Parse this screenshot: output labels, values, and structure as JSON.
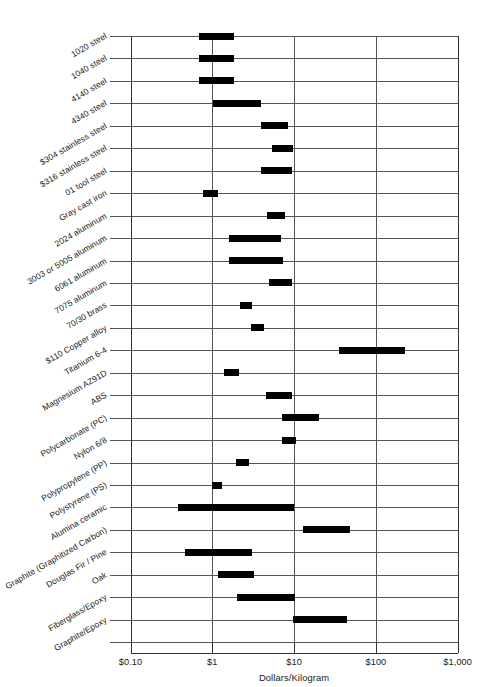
{
  "chart_data": {
    "type": "bar",
    "subtype": "floating-range-bar",
    "title": "",
    "xlabel": "Dollars/Kilogram",
    "ylabel": "",
    "xscale": "log",
    "xlim": [
      0.1,
      1000
    ],
    "xticks": [
      0.1,
      1,
      10,
      100,
      1000
    ],
    "xticklabels": [
      "$0.10",
      "$1",
      "$10",
      "$100",
      "$1,000"
    ],
    "grid": "horizontal row lines plus vertical decade lines",
    "legend": "none",
    "categories": [
      "1020 steel",
      "1040 steel",
      "4140 steel",
      "4340 steel",
      "$304 stainless steel",
      "$316 stainless steel",
      "01 tool steel",
      "Gray cast iron",
      "2024 aluminum",
      "3003 or 5005 aluminum",
      "6061 aluminum",
      "7075 aluminum",
      "70/30 brass",
      "$110 Copper alloy",
      "Titanium 6-4",
      "Magnesium AZ91D",
      "ABS",
      "Polycarbonate (PC)",
      "Nylon 6/8",
      "Polypropylene (PP)",
      "Polystyrene (PS)",
      "Alumina ceramic",
      "Graphite (Graphitized Carbon)",
      "Douglas Fir / Pine",
      "Oak",
      "Fiberglass/Epoxy",
      "Graphite/Epoxy"
    ],
    "ranges": [
      {
        "category": "1020 steel",
        "low": 0.68,
        "high": 1.85
      },
      {
        "category": "1040 steel",
        "low": 0.68,
        "high": 1.85
      },
      {
        "category": "4140 steel",
        "low": 0.68,
        "high": 1.85
      },
      {
        "category": "4340 steel",
        "low": 1.03,
        "high": 3.95
      },
      {
        "category": "$304 stainless steel",
        "low": 3.95,
        "high": 8.4
      },
      {
        "category": "$316 stainless steel",
        "low": 5.4,
        "high": 9.7
      },
      {
        "category": "01 tool steel",
        "low": 3.95,
        "high": 9.3
      },
      {
        "category": "Gray cast iron",
        "low": 0.78,
        "high": 1.18
      },
      {
        "category": "2024 aluminum",
        "low": 4.7,
        "high": 7.8
      },
      {
        "category": "3003 or 5005 aluminum",
        "low": 1.6,
        "high": 6.9
      },
      {
        "category": "6061 aluminum",
        "low": 1.6,
        "high": 7.4
      },
      {
        "category": "7075 aluminum",
        "low": 4.9,
        "high": 9.4
      },
      {
        "category": "70/30 brass",
        "low": 2.2,
        "high": 3.1
      },
      {
        "category": "$110 Copper alloy",
        "low": 3.0,
        "high": 4.3
      },
      {
        "category": "Titanium 6-4",
        "low": 35.0,
        "high": 230.0
      },
      {
        "category": "Magnesium AZ91D",
        "low": 1.4,
        "high": 2.1
      },
      {
        "category": "ABS",
        "low": 4.5,
        "high": 9.5
      },
      {
        "category": "Polycarbonate (PC)",
        "low": 7.2,
        "high": 20.0
      },
      {
        "category": "Nylon 6/8",
        "low": 7.2,
        "high": 10.5
      },
      {
        "category": "Polypropylene (PP)",
        "low": 1.95,
        "high": 2.85
      },
      {
        "category": "Polystyrene (PS)",
        "low": 0.98,
        "high": 1.3
      },
      {
        "category": "Alumina ceramic",
        "low": 0.38,
        "high": 10.0
      },
      {
        "category": "Graphite (Graphitized Carbon)",
        "low": 13.0,
        "high": 48.0
      },
      {
        "category": "Douglas Fir / Pine",
        "low": 0.47,
        "high": 3.05
      },
      {
        "category": "Oak",
        "low": 1.18,
        "high": 3.25
      },
      {
        "category": "Fiberglass/Epoxy",
        "low": 2.0,
        "high": 10.4
      },
      {
        "category": "Graphite/Epoxy",
        "low": 9.6,
        "high": 44.0
      }
    ]
  },
  "axis": {
    "x_title": "Dollars/Kilogram",
    "x_tick_labels": [
      "$0.10",
      "$1",
      "$10",
      "$100",
      "$1,000"
    ]
  },
  "colors": {
    "bar": "#000000",
    "gridline": "#555555",
    "frame": "#333333",
    "background": "#ffffff",
    "text": "#1a1a1a"
  }
}
